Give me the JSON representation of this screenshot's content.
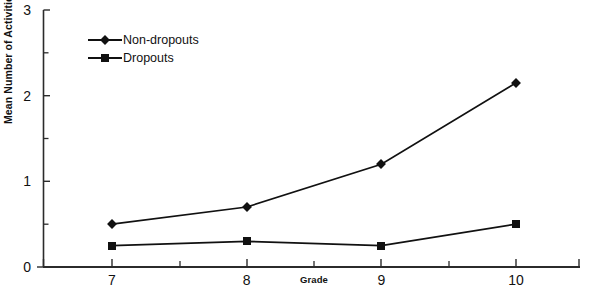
{
  "chart_data": {
    "type": "line",
    "title": "",
    "xlabel": "Grade",
    "ylabel": "Mean Number of Activities",
    "x": [
      7,
      8,
      9,
      10
    ],
    "categories": [
      "7",
      "8",
      "9",
      "10"
    ],
    "series": [
      {
        "name": "Non-dropouts",
        "marker": "diamond",
        "values": [
          0.5,
          0.7,
          1.2,
          2.15
        ]
      },
      {
        "name": "Dropouts",
        "marker": "square",
        "values": [
          0.25,
          0.3,
          0.25,
          0.5
        ]
      }
    ],
    "xlim": [
      6.5,
      10.9
    ],
    "ylim": [
      0,
      3
    ],
    "ytick_labels": [
      "0",
      "1",
      "2",
      "3"
    ],
    "ytick_values": [
      0,
      1,
      2,
      3
    ],
    "yminor_values": [
      0.5,
      1.5,
      2.5
    ],
    "xtick_labels": [
      "7",
      "8",
      "9",
      "10"
    ],
    "grid": false,
    "legend_position": "inside upper-left",
    "line_color": "#111111",
    "marker_color": "#111111"
  },
  "axes": {
    "ylabel": "Mean Number of Activities",
    "xlabel": "Grade"
  },
  "legend": {
    "entries": [
      {
        "label": "Non-dropouts"
      },
      {
        "label": "Dropouts"
      }
    ]
  }
}
